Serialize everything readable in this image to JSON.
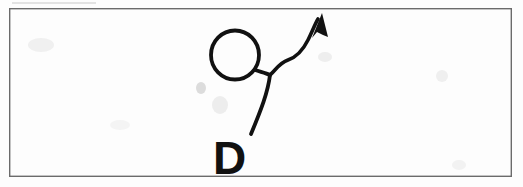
{
  "canvas": {
    "width": 523,
    "height": 187,
    "background_color": "#fefefe",
    "paper_tint": "#fdfdfd"
  },
  "frame": {
    "name": "page-border-rectangle",
    "x": 9,
    "y": 8,
    "width": 503,
    "height": 169,
    "stroke_color": "#6b6b6b",
    "stroke_width": 1.4
  },
  "stray_marks": {
    "top_edge_line": {
      "label": "faint-partial-line-above-border",
      "x1": 12,
      "y1": 3,
      "x2": 96,
      "y2": 3,
      "color": "#c9c9c9"
    },
    "smudges": [
      {
        "x": 28,
        "y": 38,
        "w": 26,
        "h": 14,
        "color": "#f0f0f0"
      },
      {
        "x": 196,
        "y": 82,
        "w": 10,
        "h": 12,
        "color": "#dcdcdc"
      },
      {
        "x": 212,
        "y": 96,
        "w": 16,
        "h": 18,
        "color": "#ededed"
      },
      {
        "x": 318,
        "y": 52,
        "w": 14,
        "h": 10,
        "color": "#eeeeee"
      },
      {
        "x": 436,
        "y": 70,
        "w": 12,
        "h": 12,
        "color": "#efefef"
      },
      {
        "x": 452,
        "y": 160,
        "w": 14,
        "h": 10,
        "color": "#f2f2f2"
      },
      {
        "x": 110,
        "y": 120,
        "w": 20,
        "h": 10,
        "color": "#f4f4f4"
      }
    ]
  },
  "sketch": {
    "title": "hand-drawn-sketch",
    "ink_color": "#111111",
    "stroke_width": 3.6,
    "circle": {
      "name": "hand-drawn-circle",
      "center_x": 235,
      "center_y": 55,
      "radius_x": 24,
      "radius_y": 24.5,
      "stroke_width": 3.8
    },
    "stem_to_letter": {
      "name": "stem-stroke",
      "path": "M 270 75 C 268 92, 261 110, 251 134",
      "stroke_width": 3.8
    },
    "circle_to_junction": {
      "name": "circle-connector-stroke",
      "path": "M 255 70 C 261 72, 266 73, 270 75",
      "stroke_width": 3.8
    },
    "arrow_curve": {
      "name": "curved-arrow-shaft",
      "path": "M 270 75 C 276 70, 279 63, 288 60 C 297 57, 303 50, 308 40 C 312 32, 315 24, 318 19",
      "stroke_width": 3.6
    },
    "arrow_head": {
      "name": "arrowhead-triangle",
      "tip_x": 322,
      "tip_y": 13,
      "points": "322,13 312,38 317,32 323,35 328,37",
      "fill": "#111111"
    }
  },
  "letter": {
    "name": "handwritten-letter-D",
    "text": "D",
    "x": 213,
    "y": 174,
    "font_size": 46,
    "color": "#111111",
    "weight": "bold"
  },
  "accessibility": {
    "description": "Scanned hand-drawn sketch inside a rectangular frame: a circle with a line descending to the letter D and a curved arrow pointing up to the right."
  }
}
